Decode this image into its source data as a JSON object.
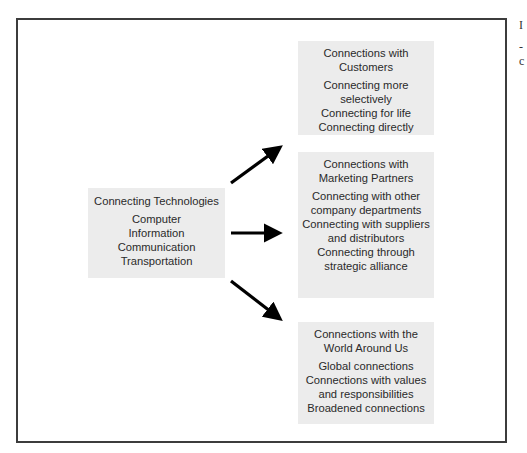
{
  "diagram": {
    "source": {
      "title": "Connecting Technologies",
      "items": [
        "Computer",
        "Information",
        "Communication",
        "Transportation"
      ]
    },
    "targets": [
      {
        "title_lines": [
          "Connections with",
          "Customers"
        ],
        "items": [
          "Connecting more",
          "selectively",
          "Connecting for life",
          "Connecting directly"
        ]
      },
      {
        "title_lines": [
          "Connections with",
          "Marketing Partners"
        ],
        "items": [
          "Connecting with other",
          "company departments",
          "Connecting with suppliers",
          "and distributors",
          "Connecting through",
          "strategic alliance"
        ]
      },
      {
        "title_lines": [
          "Connections with the",
          "World Around Us"
        ],
        "items": [
          "Global connections",
          "Connections with values",
          "and responsibilities",
          "Broadened connections"
        ]
      }
    ],
    "colors": {
      "box_fill": "#ececec",
      "frame_border": "#3c3c3c",
      "arrow": "#000000"
    }
  },
  "edge_text": [
    "I",
    "-",
    "c"
  ]
}
